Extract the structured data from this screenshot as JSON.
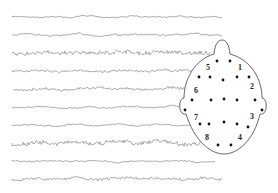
{
  "figure": {
    "trace_color": "#8a8a8a",
    "head_stroke": "#555555",
    "electrode_color": "#111111"
  },
  "traces": [
    {
      "y": 17,
      "x_start": 12,
      "x_end": 222,
      "amplitude": 1.2,
      "seed": 3,
      "freq": 0.5
    },
    {
      "y": 35,
      "x_start": 12,
      "x_end": 222,
      "amplitude": 1.8,
      "seed": 7,
      "freq": 0.45
    },
    {
      "y": 53,
      "x_start": 12,
      "x_end": 210,
      "amplitude": 2.0,
      "seed": 11,
      "freq": 1.2
    },
    {
      "y": 71,
      "x_start": 12,
      "x_end": 195,
      "amplitude": 1.4,
      "seed": 17,
      "freq": 1.0
    },
    {
      "y": 89,
      "x_start": 14,
      "x_end": 185,
      "amplitude": 1.6,
      "seed": 23,
      "freq": 1.1
    },
    {
      "y": 107,
      "x_start": 12,
      "x_end": 180,
      "amplitude": 1.6,
      "seed": 29,
      "freq": 0.5
    },
    {
      "y": 125,
      "x_start": 12,
      "x_end": 190,
      "amplitude": 1.2,
      "seed": 31,
      "freq": 0.6
    },
    {
      "y": 143,
      "x_start": 12,
      "x_end": 200,
      "amplitude": 2.0,
      "seed": 37,
      "freq": 1.3
    },
    {
      "y": 161,
      "x_start": 12,
      "x_end": 215,
      "amplitude": 1.1,
      "seed": 41,
      "freq": 0.9
    },
    {
      "y": 179,
      "x_start": 12,
      "x_end": 222,
      "amplitude": 1.6,
      "seed": 43,
      "freq": 1.0
    }
  ],
  "head": {
    "nose_tip": [
      222,
      40
    ],
    "center": [
      224,
      100
    ],
    "rx": 41,
    "ry": 50
  },
  "electrodes": [
    [
      217,
      61
    ],
    [
      230,
      61
    ],
    [
      199,
      77
    ],
    [
      210,
      77
    ],
    [
      223,
      80
    ],
    [
      237,
      77
    ],
    [
      249,
      77
    ],
    [
      192,
      100
    ],
    [
      211,
      100
    ],
    [
      224,
      99
    ],
    [
      237,
      100
    ],
    [
      255,
      100
    ],
    [
      185,
      110
    ],
    [
      262,
      110
    ],
    [
      200,
      124
    ],
    [
      209,
      124
    ],
    [
      224,
      122
    ],
    [
      237,
      124
    ],
    [
      248,
      127
    ],
    [
      218,
      145
    ],
    [
      231,
      145
    ]
  ],
  "labels": [
    {
      "text": "5",
      "x": 206,
      "y": 70
    },
    {
      "text": "1",
      "x": 238,
      "y": 70
    },
    {
      "text": "6",
      "x": 194,
      "y": 93
    },
    {
      "text": "2",
      "x": 250,
      "y": 89
    },
    {
      "text": "7",
      "x": 194,
      "y": 120
    },
    {
      "text": "3",
      "x": 250,
      "y": 119
    },
    {
      "text": "8",
      "x": 205,
      "y": 140
    },
    {
      "text": "4",
      "x": 238,
      "y": 140
    }
  ]
}
